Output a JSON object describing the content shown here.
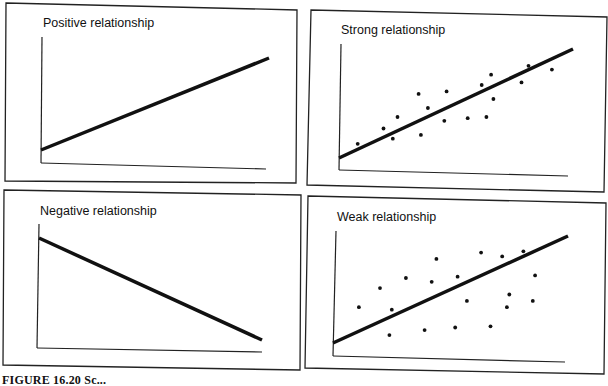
{
  "figure": {
    "caption": "FIGURE 16.20  Sc..."
  },
  "chart_data": [
    {
      "type": "line",
      "title": "Positive relationship",
      "xlabel": "",
      "ylabel": "",
      "grid": false,
      "line": {
        "x": [
          0,
          1
        ],
        "y": [
          0.1,
          0.8
        ]
      },
      "points": []
    },
    {
      "type": "scatter",
      "title": "Strong relationship",
      "xlabel": "",
      "ylabel": "",
      "grid": false,
      "line": {
        "x": [
          0,
          1
        ],
        "y": [
          0.1,
          0.95
        ]
      },
      "points": [
        [
          0.08,
          0.22
        ],
        [
          0.19,
          0.34
        ],
        [
          0.23,
          0.26
        ],
        [
          0.25,
          0.43
        ],
        [
          0.34,
          0.61
        ],
        [
          0.35,
          0.29
        ],
        [
          0.38,
          0.5
        ],
        [
          0.45,
          0.4
        ],
        [
          0.46,
          0.63
        ],
        [
          0.55,
          0.42
        ],
        [
          0.61,
          0.68
        ],
        [
          0.63,
          0.43
        ],
        [
          0.65,
          0.76
        ],
        [
          0.66,
          0.57
        ],
        [
          0.78,
          0.7
        ],
        [
          0.81,
          0.83
        ],
        [
          0.91,
          0.8
        ]
      ]
    },
    {
      "type": "line",
      "title": "Negative relationship",
      "xlabel": "",
      "ylabel": "",
      "grid": false,
      "line": {
        "x": [
          0,
          1
        ],
        "y": [
          0.9,
          0.05
        ]
      },
      "points": []
    },
    {
      "type": "scatter",
      "title": "Weak relationship",
      "xlabel": "",
      "ylabel": "",
      "grid": false,
      "line": {
        "x": [
          0,
          1
        ],
        "y": [
          0.08,
          0.85
        ]
      },
      "points": [
        [
          0.11,
          0.4
        ],
        [
          0.2,
          0.55
        ],
        [
          0.24,
          0.18
        ],
        [
          0.25,
          0.38
        ],
        [
          0.31,
          0.63
        ],
        [
          0.39,
          0.22
        ],
        [
          0.42,
          0.6
        ],
        [
          0.44,
          0.78
        ],
        [
          0.52,
          0.24
        ],
        [
          0.53,
          0.64
        ],
        [
          0.57,
          0.45
        ],
        [
          0.63,
          0.83
        ],
        [
          0.67,
          0.25
        ],
        [
          0.72,
          0.8
        ],
        [
          0.74,
          0.4
        ],
        [
          0.75,
          0.5
        ],
        [
          0.81,
          0.84
        ],
        [
          0.85,
          0.45
        ],
        [
          0.86,
          0.65
        ]
      ]
    }
  ],
  "panels": [
    {
      "title": "Positive relationship"
    },
    {
      "title": "Strong relationship"
    },
    {
      "title": "Negative relationship"
    },
    {
      "title": "Weak relationship"
    }
  ]
}
